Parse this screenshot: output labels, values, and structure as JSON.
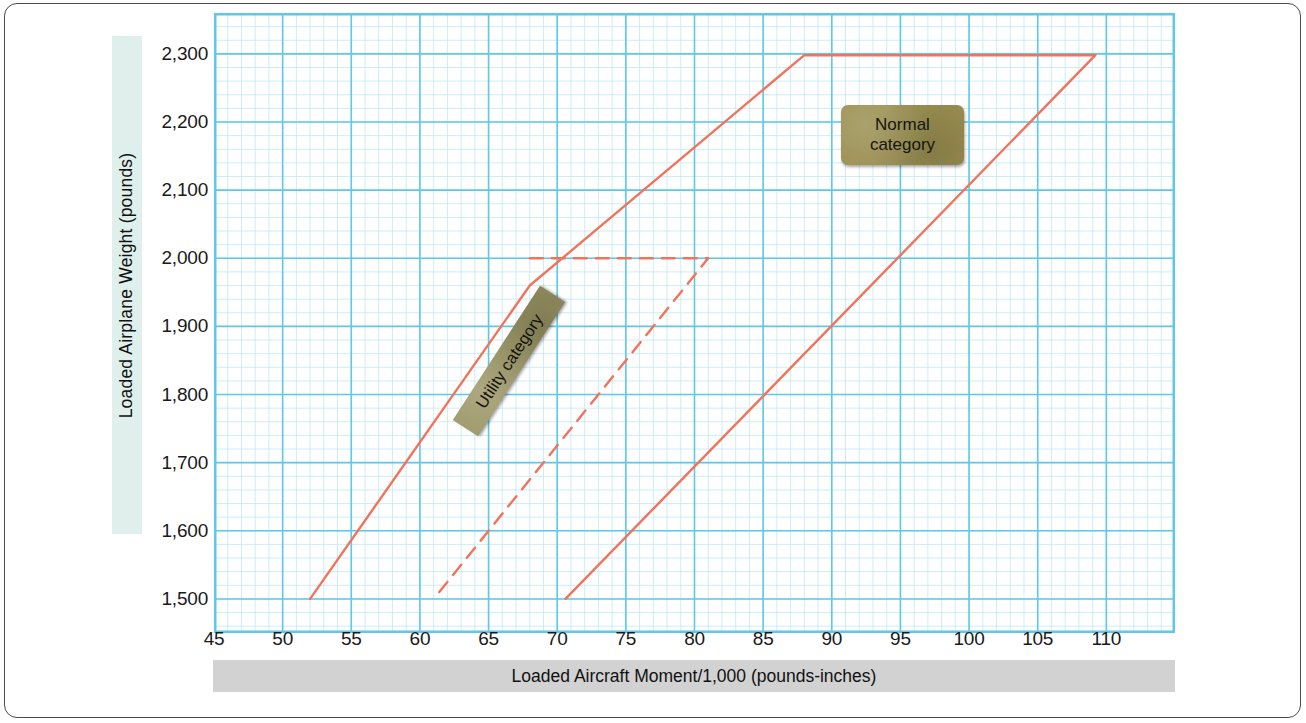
{
  "figure": {
    "y_axis_title": "Loaded  Airplane Weight (pounds)",
    "x_axis_title": "Loaded Aircraft Moment/1,000 (pounds-inches)",
    "normal_label_line1": "Normal",
    "normal_label_line2": "category",
    "utility_label": "Utility category"
  },
  "colors": {
    "envelope": "#f2735b",
    "grid_major": "#5ec8ea",
    "grid_minor": "#bfe9f6",
    "plot_border": "#5ec8ea",
    "label_box_normal": "#9a8f51",
    "label_box_utility": "#9a9463",
    "y_band": "#dff0ec",
    "x_band": "#d2d2d2",
    "frame": "#4a4a4a"
  },
  "chart_data": {
    "type": "line",
    "xlabel": "Loaded Aircraft Moment/1,000 (pounds-inches)",
    "ylabel": "Loaded  Airplane Weight (pounds)",
    "xlim": [
      45,
      115
    ],
    "ylim": [
      1450,
      2360
    ],
    "xticks": [
      45,
      50,
      55,
      60,
      65,
      70,
      75,
      80,
      85,
      90,
      95,
      100,
      105,
      110
    ],
    "xtick_labels": [
      "45",
      "50",
      "55",
      "60",
      "65",
      "70",
      "75",
      "80",
      "85",
      "90",
      "95",
      "100",
      "105",
      "110"
    ],
    "yticks": [
      1500,
      1600,
      1700,
      1800,
      1900,
      2000,
      2100,
      2200,
      2300
    ],
    "ytick_labels": [
      "1,500",
      "1,600",
      "1,700",
      "1,800",
      "1,900",
      "2,000",
      "2,100",
      "2,200",
      "2,300"
    ],
    "grid": true,
    "grid_minor_step_x": 1,
    "grid_minor_step_y": 20,
    "legend": "none",
    "series": [
      {
        "name": "Normal category envelope",
        "style": "solid",
        "color": "#f2735b",
        "points": [
          [
            52.0,
            1500
          ],
          [
            68.0,
            1960
          ],
          [
            88.0,
            2298
          ],
          [
            109.2,
            2298
          ],
          [
            70.6,
            1500
          ]
        ]
      },
      {
        "name": "Utility category envelope (dashed portion)",
        "style": "dashed",
        "color": "#f2735b",
        "points": [
          [
            68.0,
            2000
          ],
          [
            81.0,
            2000
          ],
          [
            61.0,
            1500
          ]
        ]
      }
    ],
    "annotations": [
      {
        "text": "Normal category",
        "x": 90.5,
        "y": 2205
      },
      {
        "text": "Utility category",
        "x": 65.0,
        "y": 1810,
        "rotation": -57
      }
    ]
  }
}
